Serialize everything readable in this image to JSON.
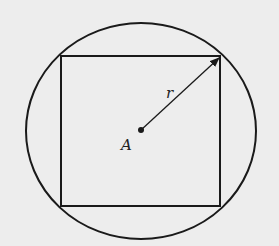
{
  "diagram": {
    "center_label": "A",
    "radius_label": "r",
    "colors": {
      "background": "#ededed",
      "stroke": "#1a1a1a"
    },
    "circle": {
      "cx": 141,
      "cy": 131,
      "rx": 115,
      "ry": 108
    },
    "square": {
      "x": 61,
      "y": 56,
      "width": 159,
      "height": 150
    },
    "radius_arrow": {
      "from": [
        141,
        130
      ],
      "to": [
        220,
        57
      ]
    }
  }
}
